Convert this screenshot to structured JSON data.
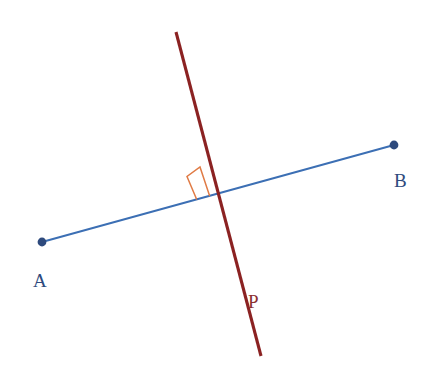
{
  "figure": {
    "width": 434,
    "height": 370,
    "background_color": "#ffffff"
  },
  "colors": {
    "segment_blue": "#3c6fb4",
    "point_navy": "#2e4a7d",
    "line_red": "#8b2222",
    "label_red": "#8b3030",
    "right_angle_orange": "#e07b45"
  },
  "labels": {
    "a": "A",
    "b": "B",
    "p": "P"
  },
  "label_positions": {
    "a": {
      "x": 33,
      "y": 270
    },
    "b": {
      "x": 394,
      "y": 170
    },
    "p": {
      "x": 248,
      "y": 291
    }
  },
  "chart_data": {
    "type": "scatter",
    "xlabel": "",
    "ylabel": "",
    "xlim": [
      0,
      434
    ],
    "ylim": [
      370,
      0
    ],
    "grid": false,
    "legend": "none",
    "points": [
      {
        "name": "A",
        "label": "A",
        "x": 42,
        "y": 242,
        "color": "#2e4a7d",
        "radius": 4.4
      },
      {
        "name": "B",
        "label": "B",
        "x": 394,
        "y": 145,
        "color": "#2e4a7d",
        "radius": 4.4
      }
    ],
    "series": [
      {
        "name": "segment-ab",
        "label": "AB",
        "kind": "line-segment",
        "color": "#3c6fb4",
        "width": 1.9,
        "x": [
          42,
          394
        ],
        "y": [
          242,
          145
        ]
      },
      {
        "name": "line-p",
        "label": "P",
        "kind": "line-segment",
        "color": "#8b2222",
        "width": 3.1,
        "x": [
          176,
          261
        ],
        "y": [
          32,
          356
        ]
      }
    ],
    "annotations": [
      {
        "name": "right-angle-marker",
        "kind": "right-angle-square",
        "color": "#e07b45",
        "width": 1.5,
        "vertex": {
          "x": 209.5,
          "y": 195.5
        },
        "polyline_x": [
          196.5,
          187.0,
          200.0,
          209.5
        ],
        "polyline_y": [
          199.0,
          176.5,
          167.0,
          195.5
        ]
      }
    ],
    "intersection": {
      "x": 209.5,
      "y": 195.5
    }
  }
}
